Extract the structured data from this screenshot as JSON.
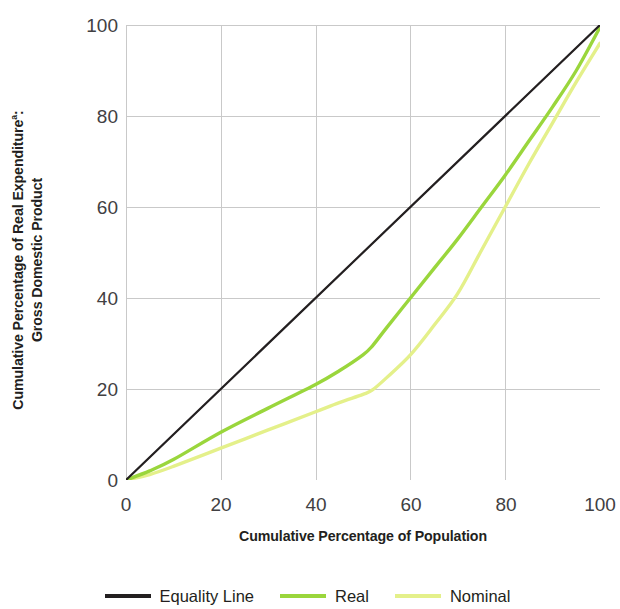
{
  "chart_data": {
    "type": "line",
    "title": "",
    "xlabel": "Cumulative Percentage of Population",
    "ylabel": "Cumulative Percentage of Real Expenditureᵃ: Gross Domestic Product",
    "ylabel_line1": "Cumulative Percentage of Real Expenditure",
    "ylabel_superscript": "a",
    "ylabel_line1_suffix": ":",
    "ylabel_line2": "Gross Domestic Product",
    "xlim": [
      0,
      100
    ],
    "ylim": [
      0,
      100
    ],
    "xticks": [
      "0",
      "20",
      "40",
      "60",
      "80",
      "100"
    ],
    "yticks": [
      "0",
      "20",
      "40",
      "60",
      "80",
      "100"
    ],
    "xtick_values": [
      0,
      20,
      40,
      60,
      80,
      100
    ],
    "ytick_values": [
      0,
      20,
      40,
      60,
      80,
      100
    ],
    "grid": true,
    "grid_color": "#c9c9c9",
    "legend_position": "bottom",
    "series": [
      {
        "name": "Equality Line",
        "color": "#231f20",
        "width": 2.2,
        "x": [
          0,
          100
        ],
        "values": [
          0,
          100
        ]
      },
      {
        "name": "Real",
        "color": "#9ad63c",
        "width": 3.4,
        "x": [
          0,
          5,
          10,
          20,
          30,
          40,
          45,
          50,
          52,
          55,
          60,
          65,
          70,
          75,
          80,
          85,
          90,
          95,
          100
        ],
        "values": [
          0,
          2.0,
          4.5,
          10.5,
          15.8,
          21.0,
          24.0,
          27.5,
          29.5,
          33.5,
          40.0,
          46.5,
          53.0,
          60.0,
          67.0,
          74.5,
          82.0,
          90.0,
          99.5
        ]
      },
      {
        "name": "Nominal",
        "color": "#e4f08a",
        "width": 3.4,
        "x": [
          0,
          5,
          10,
          20,
          30,
          40,
          45,
          50,
          52,
          55,
          60,
          65,
          70,
          75,
          80,
          85,
          90,
          95,
          100
        ],
        "values": [
          0,
          1.2,
          3.0,
          7.0,
          11.0,
          15.0,
          17.0,
          18.8,
          19.8,
          22.5,
          27.5,
          34.0,
          41.0,
          50.5,
          60.0,
          69.5,
          78.5,
          87.5,
          96.0
        ]
      }
    ]
  },
  "legend": {
    "items": [
      {
        "label": "Equality Line",
        "color": "#231f20"
      },
      {
        "label": "Real",
        "color": "#9ad63c"
      },
      {
        "label": "Nominal",
        "color": "#e4f08a"
      }
    ]
  }
}
